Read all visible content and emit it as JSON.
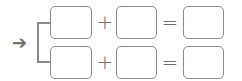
{
  "diagram": {
    "arrow": "➔",
    "rows": [
      {
        "op1": "+",
        "op2": "=",
        "box1": "",
        "box2": "",
        "box3": ""
      },
      {
        "op1": "+",
        "op2": "=",
        "box1": "",
        "box2": "",
        "box3": ""
      }
    ]
  },
  "colors": {
    "stroke": "#8a8a8a",
    "symbol": "#6e6e6e"
  }
}
